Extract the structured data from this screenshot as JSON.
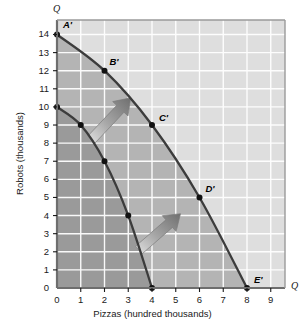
{
  "chart_data": {
    "type": "line",
    "title": "",
    "xlabel": "Pizzas (hundred thousands)",
    "ylabel": "Robots (thousands)",
    "xlim": [
      0,
      9.6
    ],
    "ylim": [
      0,
      14.8
    ],
    "xticks": [
      "0",
      "1",
      "2",
      "3",
      "4",
      "5",
      "6",
      "7",
      "8",
      "9"
    ],
    "yticks": [
      "0",
      "1",
      "2",
      "3",
      "4",
      "5",
      "6",
      "7",
      "8",
      "9",
      "10",
      "11",
      "12",
      "13",
      "14"
    ],
    "grid": true,
    "legend": "none",
    "axis_end_marker_x": "Q",
    "axis_end_marker_y": "Q",
    "series": [
      {
        "name": "new production possibilities frontier",
        "points": [
          {
            "x": 0,
            "y": 14,
            "label": "A'"
          },
          {
            "x": 2,
            "y": 12,
            "label": "B'"
          },
          {
            "x": 4,
            "y": 9,
            "label": "C'"
          },
          {
            "x": 6,
            "y": 5,
            "label": "D'"
          },
          {
            "x": 8,
            "y": 0,
            "label": "E'"
          }
        ]
      },
      {
        "name": "original production possibilities frontier",
        "points": [
          {
            "x": 0,
            "y": 10,
            "label": ""
          },
          {
            "x": 1,
            "y": 9,
            "label": ""
          },
          {
            "x": 2,
            "y": 7,
            "label": ""
          },
          {
            "x": 3,
            "y": 4,
            "label": ""
          },
          {
            "x": 4,
            "y": 0,
            "label": ""
          }
        ]
      }
    ],
    "annotations": [
      {
        "name": "shift-arrow-upper",
        "type": "arrow",
        "from": {
          "x": 1.45,
          "y": 8.2
        },
        "to": {
          "x": 3.1,
          "y": 10.5
        }
      },
      {
        "name": "shift-arrow-lower",
        "type": "arrow",
        "from": {
          "x": 3.45,
          "y": 2.1
        },
        "to": {
          "x": 5.2,
          "y": 4.1
        }
      }
    ],
    "colors": {
      "curve": "#3c3c3c",
      "point": "#111111",
      "region_inner": "#9a9a9a",
      "region_between": "#b4b4b4",
      "region_outer": "#dedede",
      "grid": "#ffffff",
      "axis": "#6e6e6e",
      "arrow": "#8d8d8d",
      "text": "#1a1a1a"
    }
  }
}
